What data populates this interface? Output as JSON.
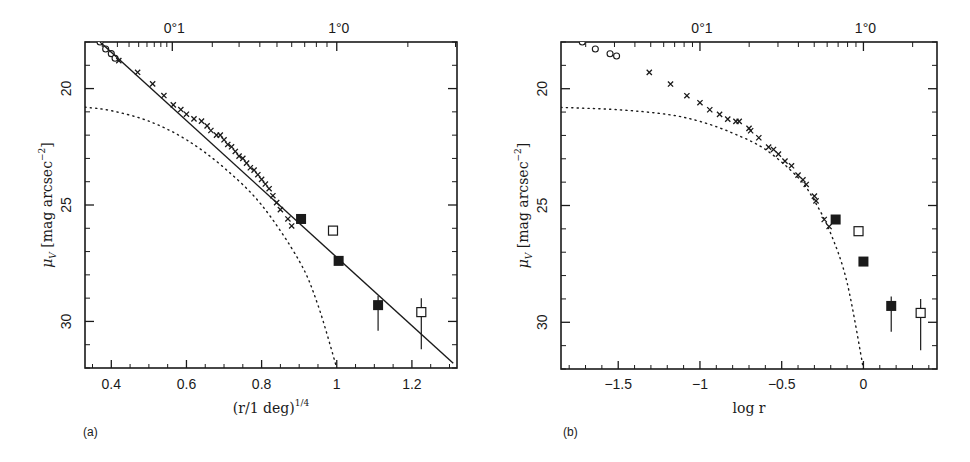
{
  "figure": {
    "panels": [
      {
        "id": "a",
        "label": "(a)",
        "xlabel": "(r/1 deg)",
        "xlabel_sup": "1/4",
        "ylabel_mu": "μ",
        "ylabel_sub": "V",
        "ylabel_rest": " [mag arcsec",
        "ylabel_sup": "−2",
        "ylabel_close": "]",
        "top_axis_labels": [
          "0°1",
          "1°0"
        ],
        "x_tick_labels": [
          "0.4",
          "0.6",
          "0.8",
          "1",
          "1.2"
        ],
        "y_tick_labels": [
          "20",
          "25",
          "30"
        ]
      },
      {
        "id": "b",
        "label": "(b)",
        "xlabel": "log r",
        "ylabel_mu": "μ",
        "ylabel_sub": "V",
        "ylabel_rest": " [mag arcsec",
        "ylabel_sup": "−2",
        "ylabel_close": "]",
        "top_axis_labels": [
          "0°1",
          "1°0"
        ],
        "x_tick_labels": [
          "−1.5",
          "−1",
          "−0.5",
          "0"
        ],
        "y_tick_labels": [
          "20",
          "25",
          "30"
        ]
      }
    ]
  },
  "chart_data": [
    {
      "type": "scatter",
      "panel": "a",
      "title": "",
      "xlabel": "(r/1 deg)^1/4",
      "ylabel": "μ_V [mag arcsec^-2]",
      "xlim": [
        0.33,
        1.32
      ],
      "ylim": [
        32.0,
        18.0
      ],
      "y_inverted": true,
      "top_axis": {
        "label_ticks": [
          "0°1",
          "1°0"
        ],
        "positions_x": [
          0.562,
          1.0
        ]
      },
      "x_ticks": [
        0.4,
        0.6,
        0.8,
        1.0,
        1.2
      ],
      "y_ticks": [
        20,
        25,
        30
      ],
      "series": [
        {
          "name": "open circles (inner)",
          "marker": "circle-open",
          "x": [
            0.37,
            0.385,
            0.4,
            0.41
          ],
          "y": [
            18.0,
            18.3,
            18.5,
            18.7
          ]
        },
        {
          "name": "crosses",
          "marker": "x",
          "x": [
            0.42,
            0.47,
            0.51,
            0.54,
            0.565,
            0.585,
            0.6,
            0.62,
            0.64,
            0.655,
            0.665,
            0.68,
            0.69,
            0.7,
            0.71,
            0.72,
            0.73,
            0.74,
            0.75,
            0.76,
            0.77,
            0.78,
            0.79,
            0.8,
            0.81,
            0.82,
            0.83,
            0.84,
            0.85,
            0.87,
            0.88
          ],
          "y": [
            18.8,
            19.3,
            19.8,
            20.3,
            20.7,
            20.9,
            21.1,
            21.3,
            21.4,
            21.6,
            21.8,
            22.0,
            22.0,
            22.2,
            22.4,
            22.5,
            22.7,
            22.9,
            23.0,
            23.2,
            23.4,
            23.5,
            23.7,
            23.9,
            24.1,
            24.3,
            24.6,
            24.9,
            25.2,
            25.6,
            25.9
          ]
        },
        {
          "name": "filled squares",
          "marker": "square-filled",
          "x": [
            0.905,
            1.005,
            1.11
          ],
          "y": [
            25.6,
            27.4,
            29.3
          ],
          "yerr_low": [
            0,
            0,
            1.1
          ],
          "yerr_high": [
            0,
            0,
            0.4
          ]
        },
        {
          "name": "open squares",
          "marker": "square-open",
          "x": [
            0.99,
            1.225
          ],
          "y": [
            26.1,
            29.6
          ],
          "yerr_low": [
            0,
            1.6
          ],
          "yerr_high": [
            0,
            0.6
          ]
        },
        {
          "name": "r^1/4 law fit",
          "style": "solid-line",
          "x": [
            0.37,
            1.31
          ],
          "y": [
            18.0,
            31.8
          ]
        },
        {
          "name": "model (dotted)",
          "style": "dotted-line",
          "x": [
            0.33,
            0.4,
            0.5,
            0.6,
            0.7,
            0.8,
            0.9,
            0.95,
            1.0
          ],
          "y": [
            20.8,
            20.95,
            21.4,
            22.2,
            23.4,
            25.0,
            27.4,
            29.3,
            32.0
          ]
        }
      ]
    },
    {
      "type": "scatter",
      "panel": "b",
      "title": "",
      "xlabel": "log r",
      "ylabel": "μ_V [mag arcsec^-2]",
      "xlim": [
        -1.85,
        0.45
      ],
      "ylim": [
        32.0,
        18.0
      ],
      "y_inverted": true,
      "top_axis": {
        "label_ticks": [
          "0°1",
          "1°0"
        ],
        "positions_x": [
          -1.0,
          0.0
        ]
      },
      "x_ticks": [
        -1.5,
        -1.0,
        -0.5,
        0.0
      ],
      "y_ticks": [
        20,
        25,
        30
      ],
      "series": [
        {
          "name": "open circles (inner)",
          "marker": "circle-open",
          "x": [
            -1.72,
            -1.64,
            -1.55,
            -1.51
          ],
          "y": [
            18.0,
            18.3,
            18.5,
            18.6
          ]
        },
        {
          "name": "crosses",
          "marker": "x",
          "x": [
            -1.31,
            -1.18,
            -1.08,
            -1.0,
            -0.94,
            -0.88,
            -0.83,
            -0.78,
            -0.76,
            -0.7,
            -0.69,
            -0.64,
            -0.58,
            -0.55,
            -0.52,
            -0.48,
            -0.44,
            -0.4,
            -0.37,
            -0.35,
            -0.3,
            -0.29,
            -0.24,
            -0.21
          ],
          "y": [
            19.3,
            19.8,
            20.3,
            20.6,
            20.9,
            21.1,
            21.3,
            21.4,
            21.4,
            21.7,
            21.8,
            22.1,
            22.5,
            22.6,
            22.8,
            23.1,
            23.3,
            23.7,
            23.9,
            24.1,
            24.6,
            24.8,
            25.6,
            25.9
          ]
        },
        {
          "name": "filled squares",
          "marker": "square-filled",
          "x": [
            -0.17,
            0.0,
            0.17
          ],
          "y": [
            25.6,
            27.4,
            29.3
          ],
          "yerr_low": [
            0,
            0,
            1.1
          ],
          "yerr_high": [
            0,
            0,
            0.4
          ]
        },
        {
          "name": "open squares",
          "marker": "square-open",
          "x": [
            -0.03,
            0.35
          ],
          "y": [
            26.1,
            29.6
          ],
          "yerr_low": [
            0,
            1.6
          ],
          "yerr_high": [
            0,
            0.6
          ]
        },
        {
          "name": "model (dotted)",
          "style": "dotted-line",
          "x": [
            -1.85,
            -1.5,
            -1.2,
            -1.0,
            -0.8,
            -0.6,
            -0.4,
            -0.3,
            -0.2,
            -0.1,
            0.0
          ],
          "y": [
            20.8,
            20.9,
            21.1,
            21.4,
            21.9,
            22.6,
            23.8,
            24.8,
            26.2,
            28.3,
            32.0
          ]
        }
      ]
    }
  ]
}
